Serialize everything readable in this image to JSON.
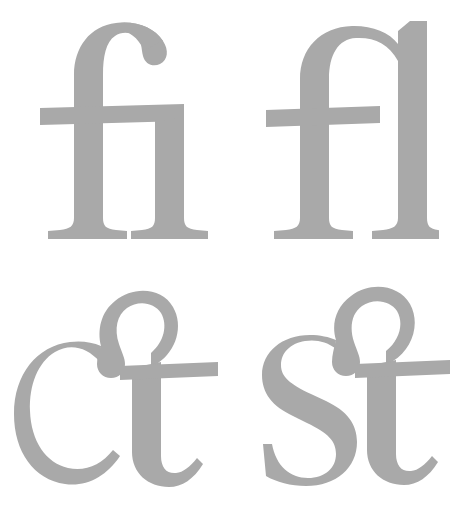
{
  "sheet": {
    "title": "Typographic Ligature Specimen",
    "background_color": "#ffffff",
    "glyph_color": "#a9a9a9",
    "width": 460,
    "height": 515,
    "columns": 2,
    "rows": 2,
    "typeface_style": "old-style serif",
    "caption": ""
  },
  "glyphs": [
    {
      "id": "fi",
      "label": "fi",
      "name": "fi-ligature",
      "unicode": "ﬁ",
      "components": [
        "f",
        "dotless i"
      ],
      "type": "standard ligature",
      "position": "top-left",
      "color": "#a9a9a9"
    },
    {
      "id": "fl",
      "label": "fl",
      "name": "fl-ligature",
      "unicode": "ﬂ",
      "components": [
        "f",
        "l"
      ],
      "type": "standard ligature",
      "position": "top-right",
      "color": "#a9a9a9"
    },
    {
      "id": "ct",
      "label": "ct",
      "name": "ct-ligature",
      "unicode": "ct",
      "components": [
        "c",
        "t"
      ],
      "type": "discretionary ligature",
      "position": "bottom-left",
      "color": "#a9a9a9"
    },
    {
      "id": "st",
      "label": "st",
      "name": "st-ligature",
      "unicode": "ﬆ",
      "components": [
        "s",
        "t"
      ],
      "type": "discretionary ligature",
      "position": "bottom-right",
      "color": "#a9a9a9"
    }
  ]
}
